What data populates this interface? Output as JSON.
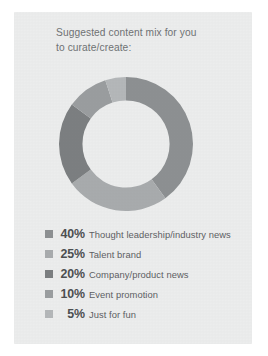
{
  "card": {
    "title": "Suggested content mix for you\nto curate/create:",
    "background_color": "#eceded"
  },
  "chart_data": {
    "type": "pie",
    "variant": "donut",
    "title": "Suggested content mix for you to curate/create:",
    "categories": [
      "Thought leadership/industry news",
      "Talent brand",
      "Company/product news",
      "Event promotion",
      "Just for fun"
    ],
    "values": [
      40,
      25,
      20,
      10,
      5
    ],
    "value_labels": [
      "40%",
      "25%",
      "20%",
      "10%",
      "5%"
    ],
    "units": "percent",
    "total": 100,
    "colors": [
      "#8d9092",
      "#a8abad",
      "#7c7f81",
      "#9a9d9f",
      "#b4b7b9"
    ],
    "start_angle_deg": 0,
    "direction": "clockwise",
    "inner_radius_ratio": 0.65,
    "legend_position": "bottom",
    "grid": false
  },
  "legend": {
    "items": [
      {
        "swatch": "#8d9092",
        "pct": "40%",
        "label": "Thought leadership/industry news"
      },
      {
        "swatch": "#a8abad",
        "pct": "25%",
        "label": "Talent brand"
      },
      {
        "swatch": "#7c7f81",
        "pct": "20%",
        "label": "Company/product news"
      },
      {
        "swatch": "#9a9d9f",
        "pct": "10%",
        "label": "Event promotion"
      },
      {
        "swatch": "#b4b7b9",
        "pct": "5%",
        "label": "Just for fun"
      }
    ]
  }
}
